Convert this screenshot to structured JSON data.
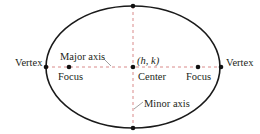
{
  "diagram": {
    "type": "ellipse",
    "colors": {
      "outline": "#1a1a1a",
      "axis": "#d98a8a",
      "point": "#111111",
      "text": "#231f20"
    },
    "ellipse": {
      "cx": 133,
      "cy": 67,
      "rx": 87,
      "ry": 61
    },
    "labels": {
      "vertex_left": "Vertex",
      "vertex_right": "Vertex",
      "focus_left": "Focus",
      "focus_right": "Focus",
      "center": "Center",
      "center_coords": "(h, k)",
      "major_axis": "Major axis",
      "minor_axis": "Minor axis"
    }
  }
}
